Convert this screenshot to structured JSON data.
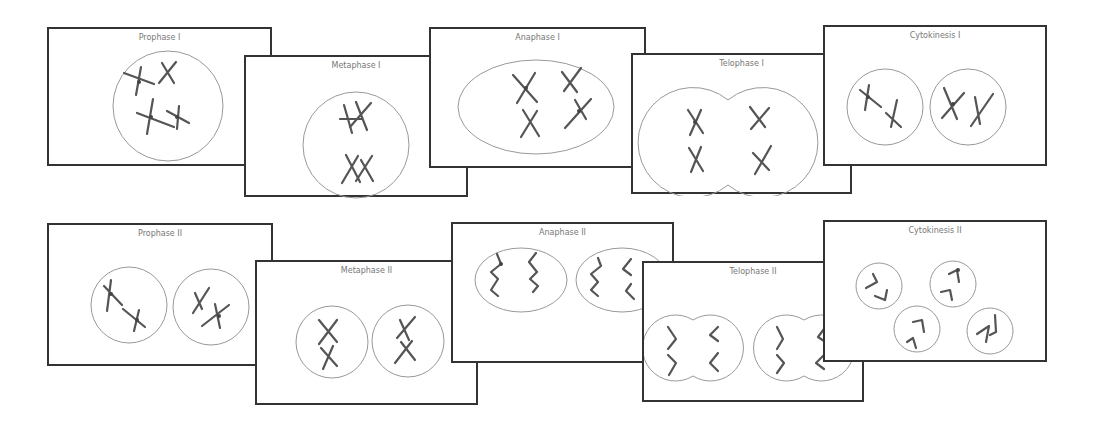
{
  "diagram": {
    "rows": [
      {
        "name": "Meiosis I",
        "panels": [
          {
            "id": "prophase-1",
            "title": "Prophase I"
          },
          {
            "id": "metaphase-1",
            "title": "Metaphase I"
          },
          {
            "id": "anaphase-1",
            "title": "Anaphase I"
          },
          {
            "id": "telophase-1",
            "title": "Telophase I"
          },
          {
            "id": "cytokinesis-1",
            "title": "Cytokinesis I"
          }
        ]
      },
      {
        "name": "Meiosis II",
        "panels": [
          {
            "id": "prophase-2",
            "title": "Prophase II"
          },
          {
            "id": "metaphase-2",
            "title": "Metaphase II"
          },
          {
            "id": "anaphase-2",
            "title": "Anaphase II"
          },
          {
            "id": "telophase-2",
            "title": "Telophase II"
          },
          {
            "id": "cytokinesis-2",
            "title": "Cytokinesis II"
          }
        ]
      }
    ],
    "colors": {
      "border": "#333333",
      "cell_outline": "#999999",
      "chromosome": "#555555",
      "title": "#777777"
    }
  }
}
